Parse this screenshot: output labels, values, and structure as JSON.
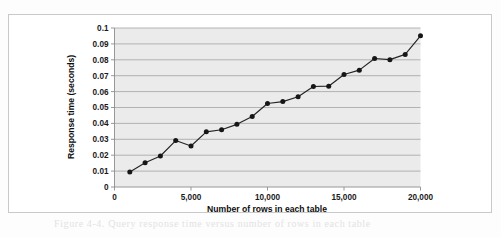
{
  "figure": {
    "caption_smudge": "Figure 4-4. Query response time versus number of rows in each table"
  },
  "chart_data": {
    "type": "line",
    "title": "",
    "subtitle": "",
    "xlabel": "Number of rows in each table",
    "ylabel": "Response time (seconds)",
    "xlim": [
      0,
      20000
    ],
    "ylim": [
      0,
      0.1
    ],
    "grid": "horizontal",
    "legend": "none",
    "markers": "filled-circle",
    "x_tick_labels": [
      "0",
      "5,000",
      "10,000",
      "15,000",
      "20,000"
    ],
    "x_tick_values": [
      0,
      5000,
      10000,
      15000,
      20000
    ],
    "y_tick_labels": [
      "0",
      "0.01",
      "0.02",
      "0.03",
      "0.04",
      "0.05",
      "0.06",
      "0.07",
      "0.08",
      "0.09",
      "0.1"
    ],
    "y_tick_values": [
      0,
      0.01,
      0.02,
      0.03,
      0.04,
      0.05,
      0.06,
      0.07,
      0.08,
      0.09,
      0.1
    ],
    "x": [
      1000,
      2000,
      3000,
      4000,
      5000,
      6000,
      7000,
      8000,
      9000,
      10000,
      11000,
      12000,
      13000,
      14000,
      15000,
      16000,
      17000,
      18000,
      19000,
      20000
    ],
    "values": [
      0.0095,
      0.0152,
      0.0195,
      0.0292,
      0.0258,
      0.0347,
      0.036,
      0.0394,
      0.0443,
      0.0525,
      0.0537,
      0.0568,
      0.0632,
      0.0634,
      0.0708,
      0.0735,
      0.0808,
      0.0801,
      0.0834,
      0.0951
    ],
    "series": [
      {
        "name": "Response time",
        "color": "#242424",
        "values": [
          0.0095,
          0.0152,
          0.0195,
          0.0292,
          0.0258,
          0.0347,
          0.036,
          0.0394,
          0.0443,
          0.0525,
          0.0537,
          0.0568,
          0.0632,
          0.0634,
          0.0708,
          0.0735,
          0.0808,
          0.0801,
          0.0834,
          0.0951
        ]
      }
    ],
    "colors": {
      "plot_background": "#ebebeb",
      "gridline": "#9a9a9a",
      "axis": "#8d8d8d",
      "series": "#242424",
      "frame": "#c9c9c9"
    }
  }
}
